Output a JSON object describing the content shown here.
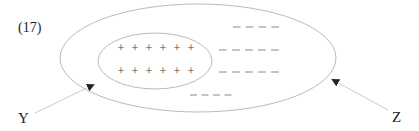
{
  "figure": {
    "number_label": "(17)",
    "labels": {
      "left": "Y",
      "right": "Z"
    },
    "colors": {
      "outline": "#bbbbbb",
      "arrow_line": "#cccccc",
      "arrowhead": "#222222",
      "text": "#222222",
      "plus": "#444444",
      "dash": "#888888"
    },
    "outer_ellipse": {
      "cx": 198,
      "cy": 58,
      "rx": 138,
      "ry": 54
    },
    "inner_ellipse": {
      "cx": 155,
      "cy": 61,
      "rx": 57,
      "ry": 28
    },
    "plus_symbol": "+",
    "plus_rows": [
      {
        "y": 52,
        "x": [
          121,
          135,
          149,
          163,
          177,
          191
        ]
      },
      {
        "y": 75,
        "x": [
          121,
          135,
          149,
          163,
          177,
          191
        ]
      }
    ],
    "dash_rows": [
      {
        "y": 27,
        "count": 4,
        "x_start": 233,
        "x_end": 284
      },
      {
        "y": 50,
        "count": 5,
        "x_start": 219,
        "x_end": 284
      },
      {
        "y": 72,
        "count": 5,
        "x_start": 219,
        "x_end": 284
      },
      {
        "y": 95,
        "count": 4,
        "x_start": 190,
        "x_end": 236
      }
    ],
    "arrows": [
      {
        "target": "Y",
        "from": [
          35,
          113
        ],
        "to": [
          93,
          85
        ]
      },
      {
        "target": "Z",
        "from": [
          388,
          110
        ],
        "to": [
          333,
          80
        ]
      }
    ]
  }
}
